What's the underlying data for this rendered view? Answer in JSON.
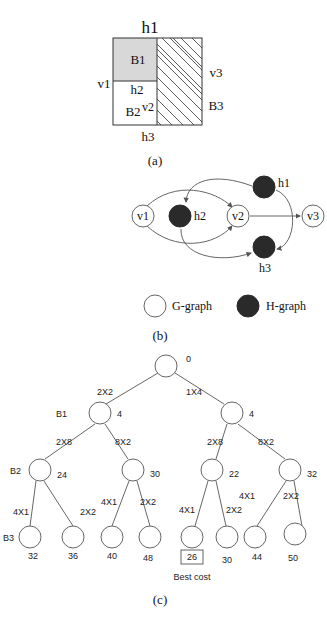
{
  "panel_a": {
    "caption": "(a)",
    "labels": {
      "h1": "h1",
      "h2": "h2",
      "h3": "h3",
      "v1": "v1",
      "v2": "v2",
      "v3": "v3",
      "b1": "B1",
      "b2": "B2",
      "b3": "B3"
    },
    "colors": {
      "b1_fill": "#d8d8d8"
    }
  },
  "panel_b": {
    "caption": "(b)",
    "nodes": {
      "v1": "v1",
      "v2": "v2",
      "v3": "v3",
      "h1": "h1",
      "h2": "h2",
      "h3": "h3"
    },
    "legend": {
      "g_graph": "G-graph",
      "h_graph": "H-graph"
    },
    "colors": {
      "h_node": "#2a2a2a",
      "g_node": "#ffffff"
    }
  },
  "panel_c": {
    "caption": "(c)",
    "root_cost": "0",
    "level1": {
      "left_edge": "2X2",
      "right_edge": "1X4",
      "left_cost": "4",
      "right_cost": "4",
      "left_label": "B1"
    },
    "level2": {
      "ll_edge": "2X8",
      "lr_edge": "8X2",
      "rl_edge": "2X8",
      "rr_edge": "8X2",
      "ll_cost": "24",
      "lr_cost": "30",
      "rl_cost": "22",
      "rr_cost": "32",
      "left_label": "B2"
    },
    "level3": {
      "edges": [
        "4X1",
        "2X2",
        "4X1",
        "2X2",
        "4X1",
        "2X2",
        "4X1",
        "2X2"
      ],
      "costs": [
        "32",
        "36",
        "40",
        "48",
        "26",
        "30",
        "44",
        "50"
      ],
      "left_label": "B3"
    },
    "best_cost_label": "Best cost"
  }
}
